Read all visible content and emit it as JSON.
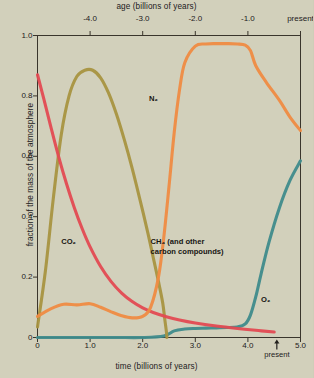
{
  "figure": {
    "background_color": "#d2d0bb",
    "axis_color": "#3a352c"
  },
  "axes": {
    "top": {
      "title": "age (billions of years)",
      "ticks": [
        {
          "label": "-4.0",
          "value": -4.0
        },
        {
          "label": "-3.0",
          "value": -3.0
        },
        {
          "label": "-2.0",
          "value": -2.0
        },
        {
          "label": "-1.0",
          "value": -1.0
        },
        {
          "label": "present",
          "value": 0.0
        }
      ]
    },
    "bottom": {
      "title": "time (billions of years)",
      "ticks": [
        {
          "label": "0",
          "value": 0.0
        },
        {
          "label": "1.0",
          "value": 1.0
        },
        {
          "label": "2.0",
          "value": 2.0
        },
        {
          "label": "3.0",
          "value": 3.0
        },
        {
          "label": "4.0",
          "value": 4.0
        },
        {
          "label": "5.0",
          "value": 5.0
        }
      ],
      "present_marker": {
        "label": "present",
        "value": 4.55
      }
    },
    "left": {
      "title": "fraction of the mass of the atmosphere",
      "ticks": [
        {
          "label": "0",
          "value": 0.0
        },
        {
          "label": "0.2",
          "value": 0.2
        },
        {
          "label": "0.4",
          "value": 0.4
        },
        {
          "label": "0.6",
          "value": 0.6
        },
        {
          "label": "0.8",
          "value": 0.8
        },
        {
          "label": "1.0",
          "value": 1.0
        }
      ]
    }
  },
  "annotations": [
    {
      "name": "n2-label",
      "text": "N₂",
      "x": 2.12,
      "y": 0.79
    },
    {
      "name": "co2-label",
      "text": "CO₂",
      "x": 0.45,
      "y": 0.315
    },
    {
      "name": "ch4-label",
      "text": "CH₄ (and other carbon compounds)",
      "x": 2.15,
      "y": 0.315
    },
    {
      "name": "o2-label",
      "text": "O₂",
      "x": 4.25,
      "y": 0.125
    }
  ],
  "chart_data": {
    "type": "line",
    "title": "",
    "xlabel": "time (billions of years)",
    "ylabel": "fraction of the mass of the atmosphere",
    "xlim": [
      0,
      5.0
    ],
    "ylim": [
      0,
      1.0
    ],
    "grid": false,
    "legend": "inline-labels",
    "secondary_xaxis": {
      "label": "age (billions of years)",
      "ticks": [
        -4.0,
        -3.0,
        -2.0,
        -1.0,
        0.0
      ],
      "tick_labels": [
        "-4.0",
        "-3.0",
        "-2.0",
        "-1.0",
        "present"
      ]
    },
    "series": [
      {
        "name": "CO2",
        "label": "CO₂",
        "color": "#e34a52",
        "x": [
          0.0,
          0.12,
          0.25,
          0.4,
          0.55,
          0.7,
          0.85,
          1.0,
          1.2,
          1.4,
          1.6,
          1.8,
          2.0,
          2.2,
          2.45,
          2.7,
          3.0,
          3.4,
          3.8,
          4.2,
          4.5
        ],
        "y": [
          0.87,
          0.79,
          0.7,
          0.6,
          0.51,
          0.43,
          0.36,
          0.3,
          0.235,
          0.185,
          0.147,
          0.119,
          0.098,
          0.083,
          0.069,
          0.058,
          0.048,
          0.038,
          0.03,
          0.023,
          0.018
        ]
      },
      {
        "name": "CH4 and other carbon compounds",
        "label": "CH₄ (and other carbon compounds)",
        "color": "#a89440",
        "x": [
          0.0,
          0.15,
          0.3,
          0.45,
          0.6,
          0.75,
          0.9,
          1.05,
          1.2,
          1.35,
          1.5,
          1.65,
          1.8,
          1.95,
          2.1,
          2.2,
          2.3,
          2.38,
          2.42,
          2.45,
          2.46
        ],
        "y": [
          0.035,
          0.22,
          0.46,
          0.67,
          0.8,
          0.865,
          0.885,
          0.885,
          0.86,
          0.81,
          0.74,
          0.655,
          0.56,
          0.455,
          0.345,
          0.265,
          0.185,
          0.115,
          0.06,
          0.02,
          0.0
        ]
      },
      {
        "name": "N2",
        "label": "N₂",
        "color": "#ef8b42",
        "x": [
          0.0,
          0.25,
          0.5,
          0.75,
          1.0,
          1.2,
          1.4,
          1.6,
          1.8,
          2.0,
          2.15,
          2.3,
          2.4,
          2.5,
          2.6,
          2.7,
          2.8,
          3.0,
          3.2,
          3.4,
          3.6,
          3.8,
          3.95,
          4.05,
          4.15,
          4.35,
          4.6,
          4.8,
          5.0
        ],
        "y": [
          0.07,
          0.095,
          0.11,
          0.108,
          0.112,
          0.1,
          0.085,
          0.072,
          0.065,
          0.07,
          0.1,
          0.2,
          0.33,
          0.5,
          0.68,
          0.82,
          0.91,
          0.965,
          0.972,
          0.973,
          0.973,
          0.972,
          0.968,
          0.95,
          0.9,
          0.845,
          0.785,
          0.73,
          0.685
        ]
      },
      {
        "name": "O2",
        "label": "O₂",
        "color": "#3f8b8b",
        "x": [
          0.0,
          0.5,
          1.0,
          1.5,
          2.0,
          2.4,
          2.6,
          2.8,
          3.0,
          3.2,
          3.4,
          3.6,
          3.8,
          3.95,
          4.05,
          4.15,
          4.25,
          4.4,
          4.6,
          4.8,
          5.0
        ],
        "y": [
          0.0,
          0.0,
          0.0,
          0.0,
          0.0,
          0.005,
          0.022,
          0.028,
          0.03,
          0.031,
          0.032,
          0.033,
          0.035,
          0.045,
          0.075,
          0.135,
          0.21,
          0.315,
          0.43,
          0.52,
          0.585
        ]
      }
    ]
  }
}
